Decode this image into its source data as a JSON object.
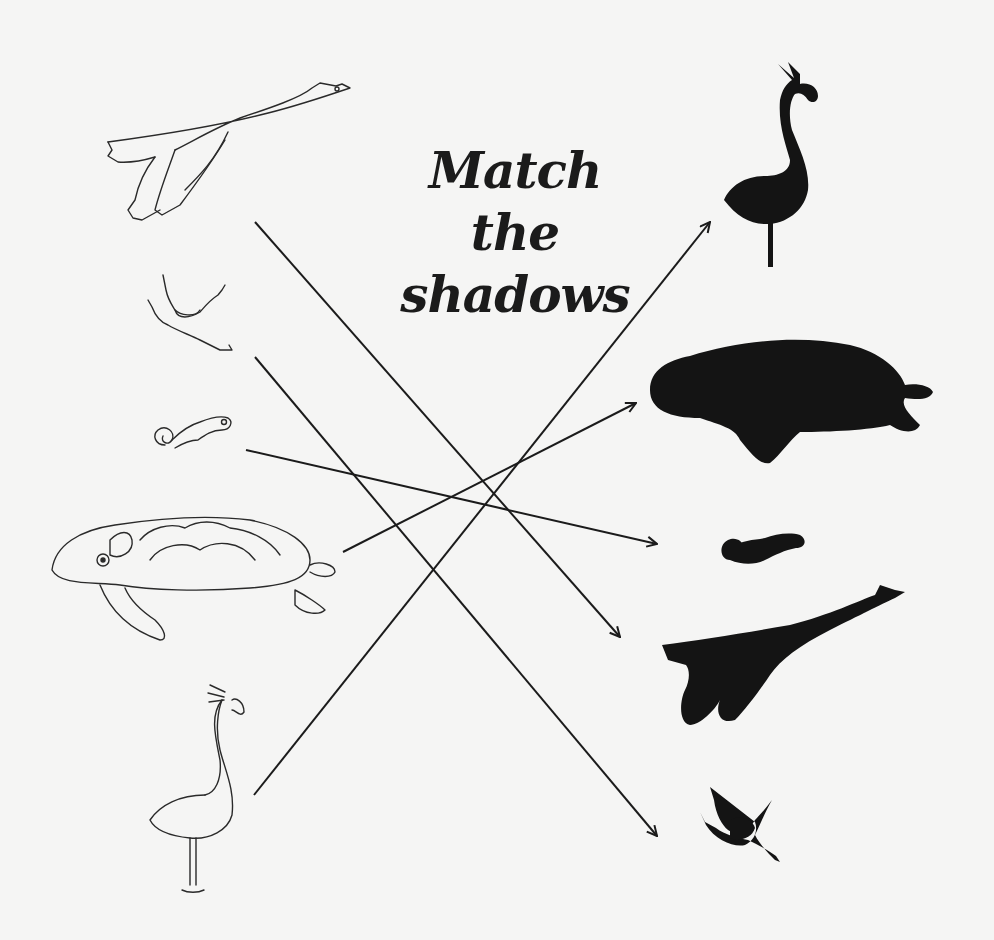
{
  "worksheet": {
    "title_line1": "Match the",
    "title_line2": "shadows",
    "ink_color": "#1b1b1b",
    "paper_color": "#f5f5f4"
  },
  "left_column": [
    {
      "id": "swan",
      "label": "swan outline drawing"
    },
    {
      "id": "frog",
      "label": "frog outline drawing"
    },
    {
      "id": "chameleon",
      "label": "chameleon outline drawing"
    },
    {
      "id": "turtle",
      "label": "sea turtle outline drawing"
    },
    {
      "id": "flamingo",
      "label": "flamingo outline drawing"
    }
  ],
  "right_column": [
    {
      "id": "flamingo-shadow",
      "label": "flamingo silhouette"
    },
    {
      "id": "turtle-shadow",
      "label": "sea turtle silhouette"
    },
    {
      "id": "chameleon-shadow",
      "label": "chameleon silhouette"
    },
    {
      "id": "swan-shadow",
      "label": "swan silhouette"
    },
    {
      "id": "frog-shadow",
      "label": "frog silhouette"
    }
  ],
  "matches": [
    {
      "from": "swan",
      "to": "swan-shadow",
      "x1": 255,
      "y1": 222,
      "x2": 620,
      "y2": 637
    },
    {
      "from": "frog",
      "to": "frog-shadow",
      "x1": 255,
      "y1": 357,
      "x2": 657,
      "y2": 836
    },
    {
      "from": "chameleon",
      "to": "chameleon-shadow",
      "x1": 246,
      "y1": 450,
      "x2": 657,
      "y2": 544
    },
    {
      "from": "turtle",
      "to": "turtle-shadow",
      "x1": 343,
      "y1": 552,
      "x2": 636,
      "y2": 403
    },
    {
      "from": "flamingo",
      "to": "flamingo-shadow",
      "x1": 254,
      "y1": 795,
      "x2": 710,
      "y2": 222
    }
  ]
}
